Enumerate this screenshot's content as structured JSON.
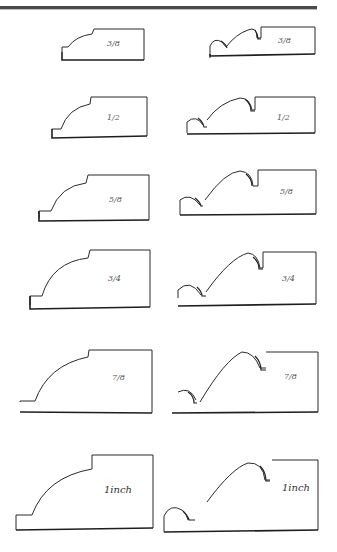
{
  "page": {
    "rule": "double top rule"
  },
  "profiles": {
    "left": [
      {
        "label": "3/8"
      },
      {
        "label": "1/2"
      },
      {
        "label": "5/8"
      },
      {
        "label": "3/4"
      },
      {
        "label": "7/8"
      },
      {
        "label": "1inch"
      }
    ],
    "right": [
      {
        "label": "3/8"
      },
      {
        "label": "1/2"
      },
      {
        "label": "5/8"
      },
      {
        "label": "3/4"
      },
      {
        "label": "7/8"
      },
      {
        "label": "1inch"
      }
    ]
  }
}
